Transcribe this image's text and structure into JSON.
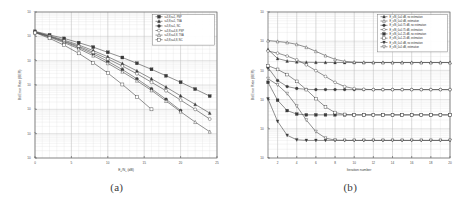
{
  "figure": {
    "subfigures": [
      {
        "caption": "(a)",
        "name": "ber-vs-ebno"
      },
      {
        "caption": "(b)",
        "name": "ber-vs-iteration"
      }
    ]
  },
  "chart_data": [
    {
      "type": "line",
      "title": "",
      "xlabel": "E_b/N_0 (dB)",
      "xlabel_main": "E",
      "xlabel_sub1": "b",
      "xlabel_mid": "/N",
      "xlabel_sub2": "0",
      "xlabel_tail": " (dB)",
      "ylabel": "Bit Error Rate (BER)",
      "xlim": [
        0,
        25
      ],
      "ylim": [
        1e-06,
        1
      ],
      "yscale": "log",
      "xticks": [
        0,
        5,
        10,
        15,
        20,
        25
      ],
      "xticklabels": [
        "0",
        "5",
        "10",
        "15",
        "20",
        "25"
      ],
      "yticks": [
        1,
        0.1,
        0.01,
        0.001,
        0.0001,
        1e-05,
        1e-06
      ],
      "yticklabels": [
        "10^0",
        "10^-1",
        "10^-2",
        "10^-3",
        "10^-4",
        "10^-5",
        "10^-6"
      ],
      "grid": true,
      "legend_position": "upper right",
      "series": [
        {
          "name": "r=3,8,s=1, PSP",
          "marker": "square-filled",
          "x": [
            0,
            2,
            4,
            6,
            8,
            10,
            12,
            14,
            16,
            18,
            20,
            22,
            24
          ],
          "y": [
            0.16,
            0.115,
            0.082,
            0.055,
            0.036,
            0.022,
            0.0135,
            0.0078,
            0.0044,
            0.0024,
            0.0013,
            0.00068,
            0.00035
          ]
        },
        {
          "name": "r=3,8,s=1, TSA",
          "marker": "triangle-filled",
          "x": [
            0,
            2,
            4,
            6,
            8,
            10,
            12,
            14,
            16,
            18,
            20,
            22,
            24
          ],
          "y": [
            0.155,
            0.105,
            0.07,
            0.044,
            0.026,
            0.0145,
            0.0076,
            0.0038,
            0.0018,
            0.00082,
            0.00036,
            0.00016,
            7e-05
          ]
        },
        {
          "name": "r=3,8,s=1, NC",
          "marker": "circle-filled",
          "x": [
            0,
            2,
            4,
            6,
            8,
            10,
            12,
            14,
            16,
            18,
            20
          ],
          "y": [
            0.15,
            0.098,
            0.061,
            0.035,
            0.019,
            0.0094,
            0.0043,
            0.0018,
            0.0007,
            0.00026,
            9e-05
          ]
        },
        {
          "name": "r=3,8,s=4,8, PSP",
          "marker": "circle-open",
          "x": [
            0,
            2,
            4,
            6,
            8,
            10,
            12,
            14,
            16,
            18,
            20,
            22,
            24
          ],
          "y": [
            0.148,
            0.1,
            0.064,
            0.039,
            0.022,
            0.0118,
            0.006,
            0.0029,
            0.0013,
            0.00058,
            0.00024,
            0.0001,
            4e-05
          ]
        },
        {
          "name": "r=3,8,s=4,8, TSA",
          "marker": "triangle-open",
          "x": [
            0,
            2,
            4,
            6,
            8,
            10,
            12,
            14,
            16,
            18,
            20,
            22,
            24
          ],
          "y": [
            0.145,
            0.092,
            0.055,
            0.031,
            0.016,
            0.0078,
            0.0035,
            0.0015,
            0.0006,
            0.00022,
            8e-05,
            3e-05,
            1.2e-05
          ]
        },
        {
          "name": "r=3,8,s=4,8, NC",
          "marker": "square-open",
          "x": [
            0,
            2,
            4,
            6,
            8,
            10,
            12,
            14,
            16
          ],
          "y": [
            0.142,
            0.083,
            0.043,
            0.02,
            0.0082,
            0.0031,
            0.00105,
            0.00033,
            0.0001
          ]
        }
      ]
    },
    {
      "type": "line",
      "title": "",
      "xlabel": "Iteration number",
      "ylabel": "Bit Error Rate (BER)",
      "xlim": [
        1,
        20
      ],
      "ylim": [
        1e-05,
        1
      ],
      "yscale": "log",
      "xticks": [
        2,
        4,
        6,
        8,
        10,
        12,
        14,
        16,
        18,
        20
      ],
      "xticklabels": [
        "2",
        "4",
        "6",
        "8",
        "10",
        "12",
        "14",
        "16",
        "18",
        "20"
      ],
      "yticks": [
        1,
        0.1,
        0.01,
        0.001,
        0.0001,
        1e-05
      ],
      "yticklabels": [
        "10^0",
        "10^-1",
        "10^-2",
        "10^-3",
        "10^-4",
        "10^-5"
      ],
      "grid": true,
      "legend_position": "upper right",
      "series": [
        {
          "name": "E_s/N_0=0 dB, no estimation",
          "marker": "triangle-filled",
          "x": [
            1,
            2,
            3,
            4,
            5,
            6,
            7,
            8,
            9,
            10,
            11,
            12,
            13,
            14,
            15,
            16,
            17,
            18,
            19,
            20
          ],
          "y": [
            0.052,
            0.0255,
            0.021,
            0.0195,
            0.019,
            0.0188,
            0.0187,
            0.0186,
            0.0186,
            0.0186,
            0.0186,
            0.0186,
            0.0186,
            0.0186,
            0.0186,
            0.0186,
            0.0186,
            0.0186,
            0.0186,
            0.0186
          ]
        },
        {
          "name": "E_s/N_0=0 dB, estimation",
          "marker": "triangle-open",
          "x": [
            1,
            2,
            3,
            4,
            5,
            6,
            7,
            8,
            9,
            10,
            11,
            12,
            13,
            14,
            15,
            16,
            17,
            18,
            19,
            20
          ],
          "y": [
            0.105,
            0.098,
            0.09,
            0.078,
            0.062,
            0.045,
            0.032,
            0.024,
            0.0205,
            0.0192,
            0.0188,
            0.0187,
            0.0186,
            0.0186,
            0.0186,
            0.0186,
            0.0186,
            0.0186,
            0.0186,
            0.0186
          ]
        },
        {
          "name": "E_s/N_0=0.75 dB, no estimation",
          "marker": "circle-filled",
          "x": [
            1,
            2,
            3,
            4,
            5,
            6,
            7,
            8,
            9,
            10,
            11,
            12,
            13,
            14,
            15,
            16,
            17,
            18,
            19,
            20
          ],
          "y": [
            0.0125,
            0.0045,
            0.0028,
            0.0024,
            0.00225,
            0.0022,
            0.0022,
            0.0022,
            0.0022,
            0.0022,
            0.0022,
            0.0022,
            0.0022,
            0.0022,
            0.0022,
            0.0022,
            0.0022,
            0.0022,
            0.0022,
            0.0022
          ]
        },
        {
          "name": "E_s/N_0=0.75 dB, estimation",
          "marker": "circle-open",
          "x": [
            1,
            2,
            3,
            4,
            5,
            6,
            7,
            8,
            9,
            10,
            11,
            12,
            13,
            14,
            15,
            16,
            17,
            18,
            19,
            20
          ],
          "y": [
            0.046,
            0.039,
            0.031,
            0.023,
            0.0155,
            0.0098,
            0.0062,
            0.0039,
            0.0028,
            0.00238,
            0.00225,
            0.0022,
            0.0022,
            0.0022,
            0.0022,
            0.0022,
            0.0022,
            0.0022,
            0.0022,
            0.0022
          ]
        },
        {
          "name": "E_s/N_0=1.25 dB, no estimation",
          "marker": "square-filled",
          "x": [
            1,
            2,
            3,
            4,
            5,
            6,
            7,
            8,
            9,
            10,
            11,
            12,
            13,
            14,
            15,
            16,
            17,
            18,
            19,
            20
          ],
          "y": [
            0.0039,
            0.00095,
            0.00042,
            0.00032,
            0.0003,
            0.0003,
            0.0003,
            0.0003,
            0.0003,
            0.0003,
            0.0003,
            0.0003,
            0.0003,
            0.0003,
            0.0003,
            0.0003,
            0.0003,
            0.0003,
            0.0003,
            0.0003
          ]
        },
        {
          "name": "E_s/N_0=1.25 dB, estimation",
          "marker": "square-open",
          "x": [
            1,
            2,
            3,
            4,
            5,
            6,
            7,
            8,
            9,
            10,
            11,
            12,
            13,
            14,
            15,
            16,
            17,
            18,
            19,
            20
          ],
          "y": [
            0.0145,
            0.0108,
            0.0072,
            0.0042,
            0.0022,
            0.00108,
            0.00056,
            0.00036,
            0.00031,
            0.0003,
            0.0003,
            0.0003,
            0.0003,
            0.0003,
            0.0003,
            0.0003,
            0.0003,
            0.0003,
            0.0003,
            0.0003
          ]
        },
        {
          "name": "E_s/N_0=5 dB, no estimation",
          "marker": "triangle-down-filled",
          "x": [
            1,
            2,
            3,
            4,
            5,
            6,
            7,
            8,
            9,
            10,
            11,
            12,
            13,
            14,
            15,
            16,
            17,
            18,
            19,
            20
          ],
          "y": [
            0.00105,
            0.00018,
            6e-05,
            4.2e-05,
            4e-05,
            4e-05,
            4e-05,
            4e-05,
            4e-05,
            4e-05,
            4e-05,
            4e-05,
            4e-05,
            4e-05,
            4e-05,
            4e-05,
            4e-05,
            4e-05,
            4e-05,
            4e-05
          ]
        },
        {
          "name": "E_s/N_0=5 dB, estimation",
          "marker": "triangle-down-open",
          "x": [
            1,
            2,
            3,
            4,
            5,
            6,
            7,
            8,
            9,
            10,
            11,
            12,
            13,
            14,
            15,
            16,
            17,
            18,
            19,
            20
          ],
          "y": [
            0.0052,
            0.0032,
            0.0016,
            0.0006,
            0.0002,
            8e-05,
            4.8e-05,
            4.1e-05,
            4e-05,
            4e-05,
            4e-05,
            4e-05,
            4e-05,
            4e-05,
            4e-05,
            4e-05,
            4e-05,
            4e-05,
            4e-05,
            4e-05
          ]
        }
      ]
    }
  ]
}
